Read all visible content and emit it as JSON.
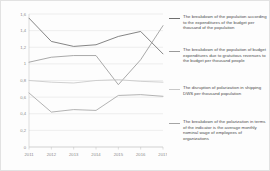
{
  "chart_data": {
    "type": "line",
    "title": "",
    "subtitle": "",
    "xlabel": "",
    "ylabel": "",
    "categories": [
      "2011",
      "2012",
      "2013",
      "2014",
      "2015",
      "2016",
      "2017"
    ],
    "ylim": [
      0,
      1.6
    ],
    "ytick_labels": [
      "1,6",
      "1,4",
      "1,2",
      "1",
      "0,8",
      "0,6",
      "0,4",
      "0,2",
      "0"
    ],
    "ytick_values": [
      1.6,
      1.4,
      1.2,
      1.0,
      0.8,
      0.6,
      0.4,
      0.2,
      0
    ],
    "grid": true,
    "legend_position": "right",
    "series": [
      {
        "name": "The breakdown of the population according to the expenditures of the budget per thousand of the population",
        "color": "#6f6f6f",
        "values": [
          1.55,
          1.27,
          1.21,
          1.23,
          1.33,
          1.39,
          1.12
        ]
      },
      {
        "name": "The breakdown of the population of budget expenditures due to gratuitous revenues to the budget per thousand people",
        "color": "#9a9a9a",
        "values": [
          1.02,
          1.08,
          1.1,
          1.1,
          0.75,
          1.05,
          1.46
        ]
      },
      {
        "name": "The disruption of polarization in shipping DWS per thousand population",
        "color": "#c8c8c8",
        "values": [
          0.8,
          0.78,
          0.77,
          0.8,
          0.81,
          0.79,
          0.78
        ]
      },
      {
        "name": "The breakdown of the polarization in terms of the indicator is the average monthly nominal wage of employees of organizations",
        "color": "#a5a5a5",
        "values": [
          0.65,
          0.42,
          0.45,
          0.44,
          0.62,
          0.63,
          0.61
        ]
      }
    ]
  },
  "legend": {
    "items": [
      {
        "label": "The breakdown of the population according to the expenditures of the budget per thousand of the population",
        "color": "#6f6f6f"
      },
      {
        "label": "The breakdown of the population of budget expenditures due to gratuitous revenues to the budget per thousand people",
        "color": "#9a9a9a"
      },
      {
        "label": "The disruption of polarization in shipping DWS per thousand population",
        "color": "#c8c8c8"
      },
      {
        "label": "The breakdown of the polarization in terms of the indicator is the average monthly nominal wage of employees of organizations",
        "color": "#a5a5a5"
      }
    ]
  }
}
